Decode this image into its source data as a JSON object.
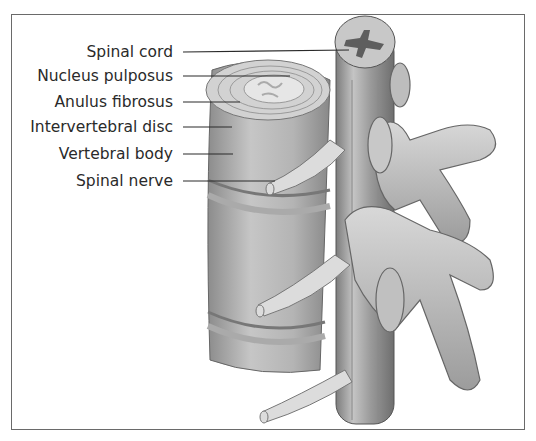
{
  "figure": {
    "type": "anatomical-illustration",
    "colors": {
      "frame": "#6a6a6a",
      "bone": "#c9c9c9",
      "bone_shadow": "#9a9a9a",
      "cord_grey_matter": "#5e5e5e",
      "text": "#2a2a2a"
    }
  },
  "labels": [
    {
      "id": "spinal-cord",
      "text": "Spinal cord",
      "y": 52
    },
    {
      "id": "nucleus-pulposus",
      "text": "Nucleus pulposus",
      "y": 76
    },
    {
      "id": "anulus-fibrosus",
      "text": "Anulus fibrosus",
      "y": 102
    },
    {
      "id": "intervertebral-disc",
      "text": "Intervertebral disc",
      "y": 127
    },
    {
      "id": "vertebral-body",
      "text": "Vertebral body",
      "y": 154
    },
    {
      "id": "spinal-nerve",
      "text": "Spinal nerve",
      "y": 181
    }
  ]
}
